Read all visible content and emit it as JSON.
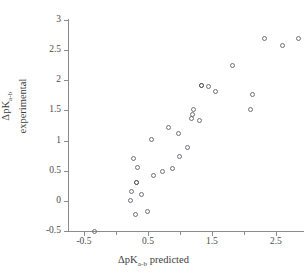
{
  "figure": {
    "background_color": "#ffffff",
    "axis_color": "#8b8b8b",
    "marker_edge_color": "#6e6e78",
    "overlap_marker_color": "#2e2e38"
  },
  "axes": {
    "x_title_prefix": "ΔpK",
    "x_title_sub": "a-b",
    "x_title_suffix": " predicted",
    "y_title_line1_prefix": "ΔpK",
    "y_title_line1_sub": "a-b",
    "y_title_line2": "experimental"
  },
  "chart_data": {
    "type": "scatter",
    "title": "",
    "xlabel": "ΔpKa-b predicted",
    "ylabel": "ΔpKa-b experimental",
    "xlim": [
      -0.75,
      2.94
    ],
    "ylim": [
      -0.5,
      3.0
    ],
    "xticks": [
      -0.5,
      0.5,
      1.5,
      2.5
    ],
    "xticklabels": [
      "-0.5",
      "0.5",
      "1.5",
      "2.5"
    ],
    "xminorticks": [
      0.0,
      1.0,
      2.0
    ],
    "yticks": [
      -0.5,
      0,
      0.5,
      1,
      1.5,
      2,
      2.5,
      3
    ],
    "yticklabels": [
      "-0.5",
      "0",
      "0.5",
      "1",
      "1.5",
      "2",
      "2.5",
      "3"
    ],
    "grid": false,
    "legend": null,
    "marker": "open-circle",
    "points": [
      {
        "x": -0.34,
        "y": -0.5,
        "overlap": false
      },
      {
        "x": 0.22,
        "y": 0.0,
        "overlap": false
      },
      {
        "x": 0.24,
        "y": 0.16,
        "overlap": false
      },
      {
        "x": 0.28,
        "y": 0.71,
        "overlap": false
      },
      {
        "x": 0.3,
        "y": -0.22,
        "overlap": false
      },
      {
        "x": 0.32,
        "y": 0.31,
        "overlap": true
      },
      {
        "x": 0.34,
        "y": 0.56,
        "overlap": false
      },
      {
        "x": 0.4,
        "y": 0.1,
        "overlap": false
      },
      {
        "x": 0.5,
        "y": -0.17,
        "overlap": false
      },
      {
        "x": 0.55,
        "y": 1.01,
        "overlap": false
      },
      {
        "x": 0.58,
        "y": 0.42,
        "overlap": false
      },
      {
        "x": 0.72,
        "y": 0.48,
        "overlap": false
      },
      {
        "x": 0.82,
        "y": 1.21,
        "overlap": false
      },
      {
        "x": 0.88,
        "y": 0.53,
        "overlap": false
      },
      {
        "x": 0.98,
        "y": 1.11,
        "overlap": false
      },
      {
        "x": 1.0,
        "y": 0.73,
        "overlap": false
      },
      {
        "x": 1.12,
        "y": 0.89,
        "overlap": false
      },
      {
        "x": 1.18,
        "y": 1.36,
        "overlap": false
      },
      {
        "x": 1.2,
        "y": 1.43,
        "overlap": false
      },
      {
        "x": 1.21,
        "y": 1.51,
        "overlap": false
      },
      {
        "x": 1.3,
        "y": 1.33,
        "overlap": false
      },
      {
        "x": 1.33,
        "y": 1.92,
        "overlap": true
      },
      {
        "x": 1.44,
        "y": 1.9,
        "overlap": false
      },
      {
        "x": 1.55,
        "y": 1.82,
        "overlap": false
      },
      {
        "x": 1.82,
        "y": 2.25,
        "overlap": false
      },
      {
        "x": 2.1,
        "y": 1.51,
        "overlap": false
      },
      {
        "x": 2.13,
        "y": 1.77,
        "overlap": false
      },
      {
        "x": 2.32,
        "y": 2.7,
        "overlap": false
      },
      {
        "x": 2.6,
        "y": 2.58,
        "overlap": false
      },
      {
        "x": 2.85,
        "y": 2.7,
        "overlap": false
      }
    ]
  }
}
